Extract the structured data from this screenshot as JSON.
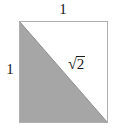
{
  "figure": {
    "background_color": "#ffffff",
    "square": {
      "stroke_color": "#b3b3b3",
      "fill_color": "#ffffff",
      "x": 19,
      "y": 21,
      "width": 89,
      "height": 102
    },
    "shaded_triangle": {
      "name": "lower-left-triangle",
      "fill_color": "#a6a6a6",
      "stroke_color": "#999999",
      "vertices": "19,21 19,123 108,123"
    },
    "diagonal": {
      "stroke_color": "#8f8f8f",
      "from": "19,21",
      "to": "108,123"
    },
    "labels": {
      "top_side": "1",
      "left_side": "1",
      "hypotenuse_radical": "√",
      "hypotenuse_radicand": "2",
      "hypotenuse_full": "√2"
    }
  }
}
